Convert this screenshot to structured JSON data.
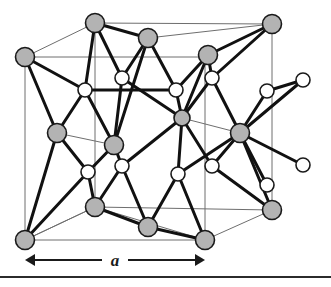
{
  "figure": {
    "kind": "crystal-structure-diagram",
    "name": "Diamond / zincblende cubic unit cell",
    "background_color": "#ffffff"
  },
  "labels": {
    "lattice_constant": "a"
  },
  "dimension_arrow": {
    "name": "lattice-constant-dimension",
    "label": "a",
    "x_start": 25,
    "x_end": 205,
    "y": 260,
    "style": "double-headed"
  },
  "footer_rule": {
    "y": 277,
    "thickness": 2,
    "color": "#2b2b2b"
  },
  "style": {
    "atom_filled_color": "#b3b3b3",
    "atom_open_color": "#ffffff",
    "atom_stroke_color": "#1a1a1a",
    "bond_color": "#111111",
    "cell_edge_color": "#6e6e6e",
    "bond_width": 3.0,
    "thin_bond_width": 1.0,
    "cell_edge_width": 1.0,
    "atom_radius_large": 9.5,
    "atom_radius_small": 7.0
  },
  "cube_vertices": {
    "front_top_left": [
      25,
      57
    ],
    "front_top_right": [
      205,
      57
    ],
    "front_bottom_left": [
      25,
      240
    ],
    "front_bottom_right": [
      205,
      240
    ],
    "back_top_left": [
      95,
      23
    ],
    "back_top_right": [
      272,
      24
    ],
    "back_bottom_left": [
      95,
      207
    ],
    "back_bottom_right": [
      272,
      210
    ]
  },
  "atoms_filled": [
    {
      "id": "A1",
      "name": "corner-atom-front-top-left",
      "x": 25,
      "y": 57,
      "r": 9.5
    },
    {
      "id": "A2",
      "name": "corner-atom-back-top-left",
      "x": 95,
      "y": 23,
      "r": 9.5
    },
    {
      "id": "A3",
      "name": "corner-atom-back-top-right",
      "x": 272,
      "y": 24,
      "r": 9.5
    },
    {
      "id": "A4",
      "name": "corner-atom-front-bottom-left",
      "x": 25,
      "y": 240,
      "r": 9.5
    },
    {
      "id": "A5",
      "name": "corner-atom-front-bottom-right",
      "x": 205,
      "y": 240,
      "r": 9.5
    },
    {
      "id": "A6",
      "name": "corner-atom-back-bottom-right",
      "x": 272,
      "y": 210,
      "r": 9.5
    },
    {
      "id": "F1",
      "name": "face-center-atom-top",
      "x": 148,
      "y": 38,
      "r": 9.5
    },
    {
      "id": "F2",
      "name": "face-center-atom-top-right",
      "x": 208,
      "y": 55,
      "r": 9.5
    },
    {
      "id": "F3",
      "name": "face-center-atom-left",
      "x": 57,
      "y": 133,
      "r": 9.5
    },
    {
      "id": "F4",
      "name": "face-center-atom-front",
      "x": 114,
      "y": 145,
      "r": 9.5
    },
    {
      "id": "F5",
      "name": "face-center-atom-interior",
      "x": 182,
      "y": 118,
      "r": 8.0
    },
    {
      "id": "F6",
      "name": "face-center-atom-right",
      "x": 240,
      "y": 133,
      "r": 9.5
    },
    {
      "id": "F7",
      "name": "face-center-atom-bottom",
      "x": 148,
      "y": 227,
      "r": 9.5
    },
    {
      "id": "F8",
      "name": "corner-atom-back-bottom-left",
      "x": 95,
      "y": 207,
      "r": 9.5
    }
  ],
  "atoms_open": [
    {
      "id": "B1",
      "name": "tetrahedral-atom-upper-left",
      "x": 85,
      "y": 90,
      "r": 7.0
    },
    {
      "id": "B2",
      "name": "tetrahedral-atom-upper-mid",
      "x": 122,
      "y": 78,
      "r": 7.0
    },
    {
      "id": "B3",
      "name": "tetrahedral-atom-upper-right-inner",
      "x": 176,
      "y": 90,
      "r": 7.0
    },
    {
      "id": "B4",
      "name": "tetrahedral-atom-upper-right",
      "x": 212,
      "y": 78,
      "r": 7.0
    },
    {
      "id": "B5",
      "name": "tetrahedral-atom-lower-left",
      "x": 88,
      "y": 172,
      "r": 7.0
    },
    {
      "id": "B6",
      "name": "tetrahedral-atom-lower-mid",
      "x": 122,
      "y": 166,
      "r": 7.0
    },
    {
      "id": "B7",
      "name": "tetrahedral-atom-lower-right-inner",
      "x": 178,
      "y": 174,
      "r": 7.0
    },
    {
      "id": "B8",
      "name": "tetrahedral-atom-lower-right",
      "x": 212,
      "y": 166,
      "r": 7.0
    },
    {
      "id": "B9",
      "name": "external-atom-upper-right",
      "x": 267,
      "y": 91,
      "r": 7.0
    },
    {
      "id": "B10",
      "name": "external-atom-far-upper-right",
      "x": 303,
      "y": 80,
      "r": 7.0
    },
    {
      "id": "B11",
      "name": "external-atom-lower-right",
      "x": 267,
      "y": 185,
      "r": 7.0
    },
    {
      "id": "B12",
      "name": "external-atom-far-lower-right",
      "x": 303,
      "y": 165,
      "r": 7.0
    }
  ],
  "cell_edges": [
    [
      "front_top_left",
      "front_top_right"
    ],
    [
      "front_top_right",
      "front_bottom_right"
    ],
    [
      "front_bottom_right",
      "front_bottom_left"
    ],
    [
      "front_bottom_left",
      "front_top_left"
    ],
    [
      "back_top_left",
      "back_top_right"
    ],
    [
      "back_top_right",
      "back_bottom_right"
    ],
    [
      "back_bottom_right",
      "back_bottom_left"
    ],
    [
      "back_bottom_left",
      "back_top_left"
    ],
    [
      "front_top_left",
      "back_top_left"
    ],
    [
      "front_top_right",
      "back_top_right"
    ],
    [
      "front_bottom_left",
      "back_bottom_left"
    ],
    [
      "front_bottom_right",
      "back_bottom_right"
    ]
  ],
  "bonds_thick": [
    [
      "A1",
      "B1"
    ],
    [
      "A2",
      "B1"
    ],
    [
      "F3",
      "B1"
    ],
    [
      "F4",
      "B1"
    ],
    [
      "F1",
      "B2"
    ],
    [
      "A2",
      "B2"
    ],
    [
      "F4",
      "B2"
    ],
    [
      "B2",
      "F5"
    ],
    [
      "F1",
      "B3"
    ],
    [
      "F5",
      "B3"
    ],
    [
      "B3",
      "F2"
    ],
    [
      "B3",
      "B1"
    ],
    [
      "F2",
      "B4"
    ],
    [
      "A3",
      "B4"
    ],
    [
      "F6",
      "B4"
    ],
    [
      "B4",
      "F5"
    ],
    [
      "F3",
      "B5"
    ],
    [
      "F4",
      "B5"
    ],
    [
      "A4",
      "B5"
    ],
    [
      "F8",
      "B5"
    ],
    [
      "F4",
      "B6"
    ],
    [
      "F7",
      "B6"
    ],
    [
      "F8",
      "B6"
    ],
    [
      "B6",
      "F5"
    ],
    [
      "F5",
      "B7"
    ],
    [
      "F7",
      "B7"
    ],
    [
      "F6",
      "B7"
    ],
    [
      "B7",
      "A5"
    ],
    [
      "F6",
      "B8"
    ],
    [
      "A6",
      "B8"
    ],
    [
      "B8",
      "F5"
    ],
    [
      "F6",
      "B9"
    ],
    [
      "B9",
      "B10"
    ],
    [
      "F6",
      "B10"
    ],
    [
      "F6",
      "B11"
    ],
    [
      "F6",
      "B12"
    ],
    [
      "A1",
      "F3"
    ],
    [
      "A4",
      "F3"
    ],
    [
      "F1",
      "A2"
    ],
    [
      "F1",
      "F4"
    ],
    [
      "A5",
      "F7"
    ],
    [
      "F8",
      "F7"
    ],
    [
      "A3",
      "F2"
    ],
    [
      "F2",
      "F5"
    ],
    [
      "A6",
      "F6"
    ]
  ],
  "bonds_thin": [
    [
      "A2",
      "F1"
    ],
    [
      "F1",
      "A3"
    ],
    [
      "A3",
      "F2"
    ],
    [
      "F3",
      "F4"
    ],
    [
      "F8",
      "F7"
    ],
    [
      "F5",
      "F6"
    ],
    [
      "A4",
      "F8"
    ],
    [
      "F8",
      "A5"
    ],
    [
      "A5",
      "F7"
    ],
    [
      "F6",
      "B9"
    ],
    [
      "F6",
      "B11"
    ],
    [
      "A6",
      "F6"
    ]
  ]
}
